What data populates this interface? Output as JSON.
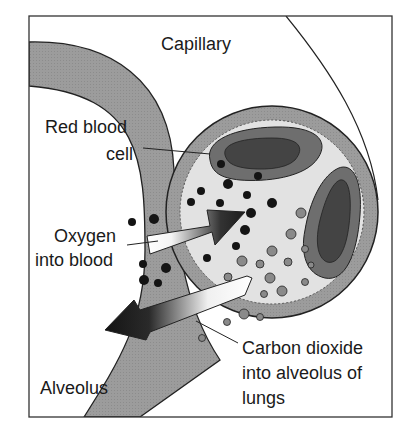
{
  "labels": {
    "capillary": "Capillary",
    "rbc_line1": "Red blood",
    "rbc_line2": "cell",
    "oxygen_line1": "Oxygen",
    "oxygen_line2": "into blood",
    "co2_line1": "Carbon dioxide",
    "co2_line2": "into alveolus of",
    "co2_line3": "lungs",
    "alveolus": "Alveolus"
  },
  "colors": {
    "wall": "#9a9a9a",
    "capillary_ring": "#a8a8a8",
    "plasma": "#e2e2e2",
    "rbc_outer": "#6e6e6e",
    "rbc_inner": "#444444",
    "oxygen_dot": "#141414",
    "co2_dot": "#8a8a8a",
    "arrow_dark": "#1c1c1c",
    "outline": "#222222"
  }
}
